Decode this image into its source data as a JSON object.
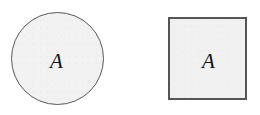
{
  "figure": {
    "background_color": "#ffffff",
    "width": 260,
    "height": 115,
    "shapes": [
      {
        "kind": "circle",
        "label": "A",
        "fill_color": "#f2f2f2",
        "stroke_color": "#5a5a5a"
      },
      {
        "kind": "square",
        "label": "A",
        "fill_color": "#f1f1f1",
        "stroke_color": "#555555"
      }
    ]
  }
}
